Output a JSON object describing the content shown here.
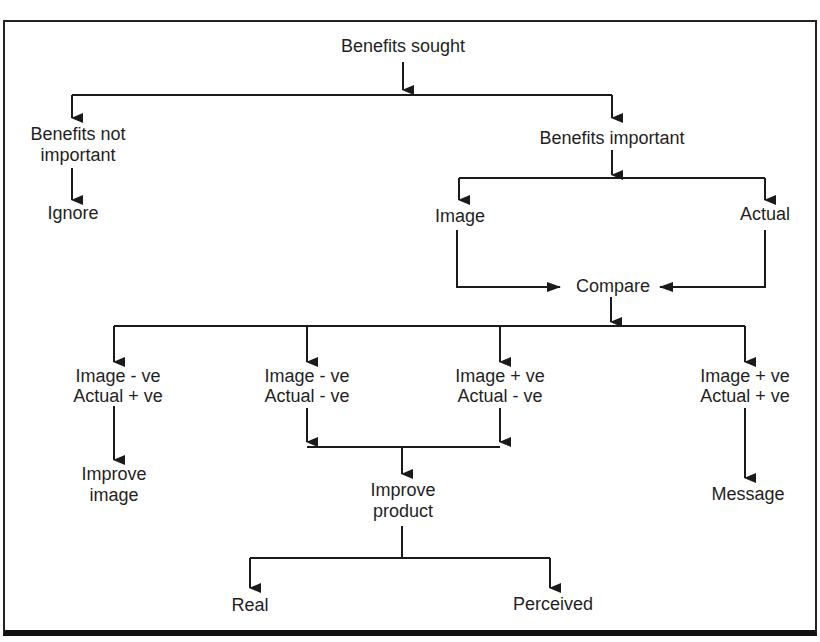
{
  "diagram": {
    "title": "Benefits sought",
    "nodes": {
      "root": "Benefits sought",
      "not_important_1": "Benefits not",
      "not_important_2": "important",
      "ignore": "Ignore",
      "important": "Benefits important",
      "image": "Image",
      "actual": "Actual",
      "compare": "Compare",
      "c1_l1": "Image - ve",
      "c1_l2": "Actual + ve",
      "c2_l1": "Image - ve",
      "c2_l2": "Actual - ve",
      "c3_l1": "Image + ve",
      "c3_l2": "Actual - ve",
      "c4_l1": "Image + ve",
      "c4_l2": "Actual + ve",
      "improve_image_1": "Improve",
      "improve_image_2": "image",
      "improve_product_1": "Improve",
      "improve_product_2": "product",
      "message": "Message",
      "real": "Real",
      "perceived": "Perceived"
    },
    "edges": [
      [
        "Benefits sought",
        "Benefits not important"
      ],
      [
        "Benefits sought",
        "Benefits important"
      ],
      [
        "Benefits not important",
        "Ignore"
      ],
      [
        "Benefits important",
        "Image"
      ],
      [
        "Benefits important",
        "Actual"
      ],
      [
        "Image",
        "Compare"
      ],
      [
        "Actual",
        "Compare"
      ],
      [
        "Compare",
        "Image - ve / Actual + ve"
      ],
      [
        "Compare",
        "Image - ve / Actual - ve"
      ],
      [
        "Compare",
        "Image + ve / Actual - ve"
      ],
      [
        "Compare",
        "Image + ve / Actual + ve"
      ],
      [
        "Image - ve / Actual + ve",
        "Improve image"
      ],
      [
        "Image - ve / Actual - ve",
        "Improve product"
      ],
      [
        "Image + ve / Actual - ve",
        "Improve product"
      ],
      [
        "Image + ve / Actual + ve",
        "Message"
      ],
      [
        "Improve product",
        "Real"
      ],
      [
        "Improve product",
        "Perceived"
      ]
    ],
    "colors": {
      "line": "#1a1a1a",
      "background": "#ffffff"
    }
  }
}
